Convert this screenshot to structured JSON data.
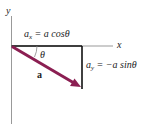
{
  "diagram": {
    "axes": {
      "x_label": "x",
      "y_label": "y"
    },
    "vector": {
      "label": "a",
      "color": "#8b1f52"
    },
    "angle_label": "θ",
    "x_component": {
      "lhs": "a",
      "sub": "x",
      "rhs": "= a cosθ"
    },
    "y_component": {
      "lhs": "a",
      "sub": "y",
      "rhs": "= −a sinθ"
    }
  }
}
